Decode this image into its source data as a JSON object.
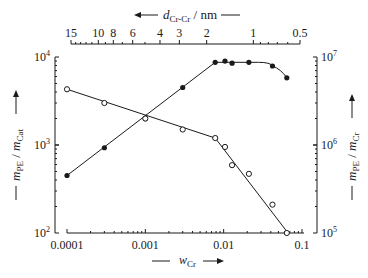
{
  "chart_data": {
    "type": "line",
    "title": "",
    "xlabel": "w_Cr",
    "xscale": "log",
    "xlim": [
      0.0001,
      0.1
    ],
    "x_ticks": [
      "0.0001",
      "0.001",
      "0.01",
      "0.1"
    ],
    "top_axis": {
      "label": "d_Cr-Cr / nm",
      "arrow": "left",
      "ticks": [
        "15",
        "10",
        "8",
        "6",
        "4",
        "3",
        "2",
        "1",
        "0.5"
      ],
      "tick_values": [
        15,
        10,
        8,
        6,
        4,
        3,
        2,
        1,
        0.5
      ]
    },
    "left_axis": {
      "label": "m_PE / m_Cat",
      "scale": "log",
      "ylim": [
        100,
        10000
      ],
      "ticks": [
        "10^2",
        "10^3",
        "10^4"
      ]
    },
    "right_axis": {
      "label": "m_PE / m_Cr",
      "scale": "log",
      "ylim": [
        100000,
        10000000
      ],
      "ticks": [
        "10^5",
        "10^6",
        "10^7"
      ]
    },
    "grid": false,
    "legend": null,
    "series": [
      {
        "name": "m_PE / m_Cat (filled circles, left axis)",
        "marker": "filled-circle",
        "axis": "left",
        "x": [
          0.0001,
          0.0003,
          0.001,
          0.003,
          0.0078,
          0.0104,
          0.0128,
          0.021,
          0.042,
          0.064
        ],
        "values": [
          450,
          930,
          1990,
          4500,
          8700,
          9000,
          8500,
          8700,
          7900,
          5800
        ]
      },
      {
        "name": "m_PE / m_Cr (open circles, right axis)",
        "marker": "open-circle",
        "axis": "right",
        "x": [
          0.0001,
          0.0003,
          0.001,
          0.003,
          0.0078,
          0.0104,
          0.0128,
          0.021,
          0.042,
          0.064
        ],
        "values": [
          4300000,
          3000000,
          2000000,
          1500000,
          1200000,
          950000,
          590000,
          470000,
          210000,
          100000
        ]
      }
    ]
  },
  "labels": {
    "x_main": "w",
    "x_sub": "Cr",
    "top_main": "d",
    "top_sub": "Cr-Cr",
    "top_unit": " / nm",
    "left_m1": "m",
    "left_s1": "PE",
    "left_sep": " / ",
    "left_m2": "m",
    "left_s2": "Cat",
    "right_m1": "m",
    "right_s1": "PE",
    "right_sep": " / ",
    "right_m2": "m",
    "right_s2": "Cr",
    "x_ticks": [
      "0.0001",
      "0.001",
      "0.01",
      "0.1"
    ],
    "top_ticks": [
      "15",
      "10",
      "8",
      "6",
      "4",
      "3",
      "2",
      "1",
      "0.5"
    ],
    "left_ticks": [
      {
        "base": "10",
        "exp": "4"
      },
      {
        "base": "10",
        "exp": "3"
      },
      {
        "base": "10",
        "exp": "2"
      }
    ],
    "right_ticks": [
      {
        "base": "10",
        "exp": "7"
      },
      {
        "base": "10",
        "exp": "6"
      },
      {
        "base": "10",
        "exp": "5"
      }
    ]
  }
}
